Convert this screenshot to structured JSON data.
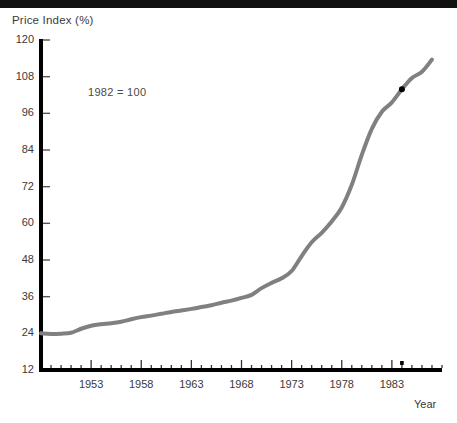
{
  "chart_data": {
    "type": "line",
    "title": "Price Index (%)",
    "xlabel": "Year",
    "ylabel": "Price Index (%)",
    "annotation": "1982 = 100",
    "xlim": [
      1948,
      1988
    ],
    "ylim": [
      12,
      120
    ],
    "yticks": [
      12,
      24,
      36,
      48,
      60,
      72,
      84,
      96,
      108,
      120
    ],
    "xticks": [
      1953,
      1958,
      1963,
      1968,
      1973,
      1978,
      1983
    ],
    "xtick_minor_step": 1,
    "grid": false,
    "legend": null,
    "line_color": "#808080",
    "marker_color": "#000000",
    "series": [
      {
        "name": "Price Index",
        "x": [
          1948,
          1949,
          1950,
          1951,
          1952,
          1953,
          1954,
          1955,
          1956,
          1957,
          1958,
          1959,
          1960,
          1961,
          1962,
          1963,
          1964,
          1965,
          1966,
          1967,
          1968,
          1969,
          1970,
          1971,
          1972,
          1973,
          1974,
          1975,
          1976,
          1977,
          1978,
          1979,
          1980,
          1981,
          1982,
          1983,
          1984,
          1985,
          1986,
          1987
        ],
        "values": [
          24.0,
          23.8,
          23.9,
          24.2,
          25.5,
          26.5,
          27.0,
          27.3,
          27.8,
          28.6,
          29.3,
          29.8,
          30.4,
          31.0,
          31.5,
          32.0,
          32.6,
          33.2,
          34.0,
          34.7,
          35.6,
          36.6,
          38.8,
          40.5,
          42.0,
          44.4,
          49.3,
          53.8,
          56.9,
          60.6,
          65.2,
          72.6,
          82.4,
          90.9,
          96.5,
          99.6,
          103.9,
          107.6,
          109.6,
          113.6
        ],
        "marker_points": [
          {
            "x": 1984,
            "y": 103.9
          }
        ]
      }
    ]
  }
}
